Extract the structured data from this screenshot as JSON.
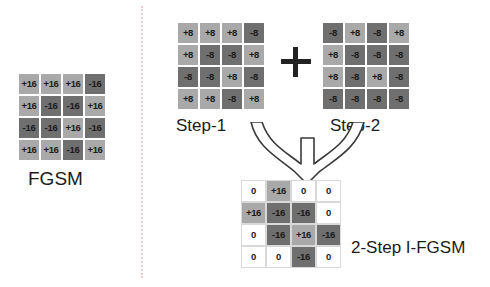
{
  "diagram": {
    "title_fgsm": "FGSM",
    "title_step1": "Step-1",
    "title_step2": "Step-2",
    "title_result": "2-Step I-FGSM",
    "operator_plus": "+",
    "colors": {
      "positive_cell": "#a9a9a9",
      "negative_cell": "#6f6f6f",
      "zero_cell": "#ffffff",
      "text": "#1b1b1b",
      "divider": "#f0c9cf",
      "arrow": "#3a3a3a"
    }
  },
  "chart_data": {
    "type": "heatmap",
    "grids": [
      {
        "name": "FGSM",
        "rows": 4,
        "cols": 4,
        "epsilon": 16,
        "values": [
          [
            16,
            16,
            16,
            -16
          ],
          [
            16,
            -16,
            -16,
            16
          ],
          [
            -16,
            -16,
            16,
            -16
          ],
          [
            16,
            16,
            -16,
            16
          ]
        ],
        "labels": [
          [
            "+16",
            "+16",
            "+16",
            "-16"
          ],
          [
            "+16",
            "-16",
            "-16",
            "+16"
          ],
          [
            "-16",
            "-16",
            "+16",
            "-16"
          ],
          [
            "+16",
            "+16",
            "-16",
            "+16"
          ]
        ]
      },
      {
        "name": "Step-1",
        "rows": 4,
        "cols": 4,
        "epsilon": 8,
        "values": [
          [
            8,
            8,
            8,
            -8
          ],
          [
            8,
            -8,
            -8,
            8
          ],
          [
            -8,
            -8,
            8,
            -8
          ],
          [
            8,
            8,
            -8,
            8
          ]
        ],
        "labels": [
          [
            "+8",
            "+8",
            "+8",
            "-8"
          ],
          [
            "+8",
            "-8",
            "-8",
            "+8"
          ],
          [
            "-8",
            "-8",
            "+8",
            "-8"
          ],
          [
            "+8",
            "+8",
            "-8",
            "+8"
          ]
        ]
      },
      {
        "name": "Step-2",
        "rows": 4,
        "cols": 4,
        "epsilon": 8,
        "values": [
          [
            -8,
            8,
            -8,
            8
          ],
          [
            8,
            -8,
            -8,
            -8
          ],
          [
            8,
            -8,
            8,
            -8
          ],
          [
            -8,
            -8,
            -8,
            -8
          ]
        ],
        "labels": [
          [
            "-8",
            "+8",
            "-8",
            "+8"
          ],
          [
            "+8",
            "-8",
            "-8",
            "-8"
          ],
          [
            "+8",
            "-8",
            "+8",
            "-8"
          ],
          [
            "-8",
            "-8",
            "-8",
            "-8"
          ]
        ]
      },
      {
        "name": "2-Step I-FGSM",
        "rows": 4,
        "cols": 4,
        "epsilon": 16,
        "values": [
          [
            0,
            16,
            0,
            0
          ],
          [
            16,
            -16,
            -16,
            0
          ],
          [
            0,
            -16,
            16,
            -16
          ],
          [
            0,
            0,
            -16,
            0
          ]
        ],
        "labels": [
          [
            "0",
            "+16",
            "0",
            "0"
          ],
          [
            "+16",
            "-16",
            "-16",
            "0"
          ],
          [
            "0",
            "-16",
            "+16",
            "-16"
          ],
          [
            "0",
            "0",
            "-16",
            "0"
          ]
        ]
      }
    ]
  }
}
